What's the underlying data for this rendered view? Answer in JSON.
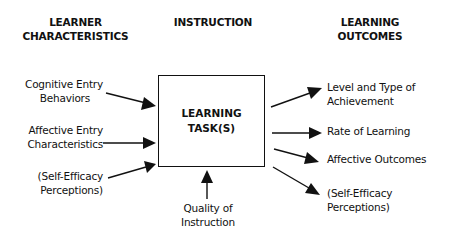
{
  "headers": {
    "learner": [
      "LEARNER",
      "CHARACTERISTICS"
    ],
    "instruction": [
      "INSTRUCTION"
    ],
    "outcomes": [
      "LEARNING",
      "OUTCOMES"
    ]
  },
  "center_box": {
    "label": [
      "LEARNING",
      "TASK(S)"
    ]
  },
  "inputs": [
    {
      "lines": [
        "Cognitive Entry",
        "Behaviors"
      ]
    },
    {
      "lines": [
        "Affective Entry",
        "Characteristics"
      ]
    },
    {
      "lines": [
        "(Self-Efficacy",
        "Perceptions)"
      ]
    }
  ],
  "instruction_input": {
    "lines": [
      "Quality of",
      "Instruction"
    ]
  },
  "outputs": [
    {
      "lines": [
        "Level and Type of",
        "Achievement"
      ]
    },
    {
      "lines": [
        "Rate of Learning"
      ]
    },
    {
      "lines": [
        "Affective Outcomes"
      ]
    },
    {
      "lines": [
        "(Self-Efficacy",
        "Perceptions)"
      ]
    }
  ],
  "colors": {
    "ink": "#111111",
    "background": "#ffffff"
  }
}
